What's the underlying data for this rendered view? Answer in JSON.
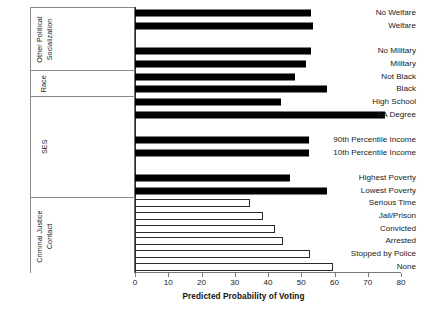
{
  "chart_data": {
    "type": "bar",
    "orientation": "horizontal",
    "title": "",
    "xlabel": "Predicted Probability of Voting",
    "ylabel": "",
    "xlim": [
      0,
      80
    ],
    "xticks": [
      0,
      10,
      20,
      30,
      40,
      50,
      60,
      70,
      80
    ],
    "grid": false,
    "legend": null,
    "groups": [
      {
        "name": "Other Political Socialization",
        "name_lines": [
          "Other Political",
          "Socialization"
        ],
        "style": "filled",
        "categories": [
          "No Welfare",
          "Welfare",
          "",
          "No Military",
          "Military"
        ],
        "values": [
          53,
          53.6,
          null,
          53,
          51.5
        ]
      },
      {
        "name": "Race",
        "name_lines": [
          "Race"
        ],
        "style": "filled",
        "categories": [
          "Not Black",
          "Black"
        ],
        "values": [
          48,
          57.8
        ]
      },
      {
        "name": "SES",
        "name_lines": [
          "SES"
        ],
        "style": "filled",
        "categories": [
          "High School",
          "BA Degree",
          "",
          "90th Percentile Income",
          "10th Percentile Income",
          "",
          "Highest Poverty",
          "Lowest Poverty"
        ],
        "values": [
          44,
          75.3,
          null,
          52.4,
          52.4,
          null,
          46.7,
          57.8
        ]
      },
      {
        "name": "Criminal Justice Contact",
        "name_lines": [
          "Criminal Justice",
          "Contact"
        ],
        "style": "hollow",
        "categories": [
          "Serious Time",
          "Jail/Prison",
          "Convicted",
          "Arrested",
          "Stopped by Police",
          "None"
        ],
        "values": [
          34.6,
          38.5,
          42,
          44.5,
          52.7,
          59.6
        ]
      }
    ],
    "colors": {
      "bar_filled": "#000000",
      "bar_hollow_fill": "#ffffff",
      "bar_outline": "#2b2b2b",
      "axis": "#7a7a7a",
      "text": "#1a1a1a",
      "background": "#ffffff"
    }
  }
}
